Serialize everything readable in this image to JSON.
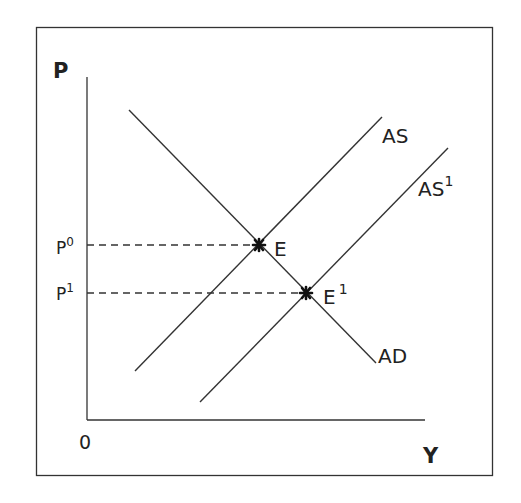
{
  "diagram": {
    "type": "AS-AD shift",
    "axes": {
      "y_label": "P",
      "x_label": "Y",
      "origin_label": "0"
    },
    "price_levels": [
      {
        "base": "P",
        "sup": "0",
        "y": 245
      },
      {
        "base": "P",
        "sup": "1",
        "y": 293
      }
    ],
    "curves": [
      {
        "id": "AD",
        "label": "AD",
        "sup": "",
        "x1": 129,
        "y1": 110,
        "x2": 376,
        "y2": 363
      },
      {
        "id": "AS",
        "label": "AS",
        "sup": "",
        "x1": 135,
        "y1": 371,
        "x2": 382,
        "y2": 117
      },
      {
        "id": "AS1",
        "label": "AS",
        "sup": "1",
        "x1": 200,
        "y1": 402,
        "x2": 448,
        "y2": 148
      }
    ],
    "equilibria": [
      {
        "base": "E",
        "sup": "",
        "x": 259,
        "y": 245
      },
      {
        "base": "E",
        "sup": "1",
        "x": 306,
        "y": 293
      }
    ],
    "colors": {
      "line": "#333333",
      "text": "#222222",
      "background": "#ffffff"
    }
  }
}
